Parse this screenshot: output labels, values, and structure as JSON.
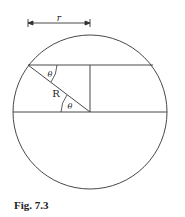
{
  "figure": {
    "caption": "Fig. 7.3",
    "labels": {
      "radius_small": "r",
      "radius_large": "R",
      "angle_top": "θ",
      "angle_bottom": "θ"
    },
    "geometry": {
      "circle": {
        "cx": 90,
        "cy": 112,
        "r": 77
      },
      "top_chord_y": 65,
      "diameter_y": 112,
      "vertical_x": 90
    }
  }
}
